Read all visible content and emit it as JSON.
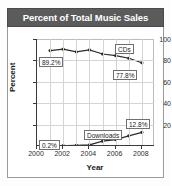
{
  "title": "Percent of Total Music Sales",
  "chart_data": {
    "type": "line",
    "title": "Percent of Total Music Sales",
    "xlabel": "Year",
    "ylabel": "Percent",
    "xlim": [
      2000,
      2009
    ],
    "ylim": [
      0,
      100
    ],
    "xticks": [
      "2000",
      "2002",
      "2004",
      "2006",
      "2008"
    ],
    "yticks": [
      "20",
      "40",
      "60",
      "80",
      "100"
    ],
    "grid": true,
    "legend": "inline-labels",
    "x": [
      2001,
      2002,
      2003,
      2004,
      2005,
      2006,
      2007,
      2008
    ],
    "series": [
      {
        "name": "CDs",
        "values": [
          89.2,
          90.5,
          88.0,
          89.8,
          86.0,
          84.5,
          82.0,
          77.8
        ],
        "color": "#2b2b2b"
      },
      {
        "name": "Downloads",
        "values": [
          0.2,
          0.3,
          0.6,
          1.0,
          4.5,
          6.0,
          9.5,
          12.8
        ],
        "color": "#2b2b2b"
      }
    ],
    "annotations": [
      {
        "text": "89.2%",
        "series": "CDs",
        "x": 2001
      },
      {
        "text": "77.8%",
        "series": "CDs",
        "x": 2008
      },
      {
        "text": "CDs",
        "series": "CDs"
      },
      {
        "text": "0.2%",
        "series": "Downloads",
        "x": 2001
      },
      {
        "text": "12.8%",
        "series": "Downloads",
        "x": 2008
      },
      {
        "text": "Downloads",
        "series": "Downloads"
      }
    ]
  },
  "colors": {
    "banner": "#5b5b5b",
    "banner_text": "#ffffff",
    "axis": "#3a3a3a",
    "grid": "#d5d5d5",
    "line": "#2b2b2b",
    "callout_border": "#6f6f6f"
  }
}
